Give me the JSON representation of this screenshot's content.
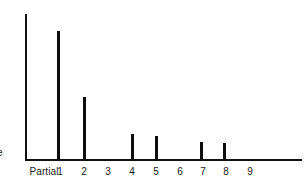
{
  "figure": {
    "name": "harmonic-partial-amplitude-spectrum",
    "axis_color": "#111111",
    "bar_color": "#0d0d0d",
    "background": "#ffffff",
    "y_axis_label_fragment": "e"
  },
  "axis": {
    "x_label_prefix": "Partial",
    "tick_labels": [
      "1",
      "2",
      "3",
      "4",
      "5",
      "6",
      "7",
      "8",
      "9"
    ]
  },
  "chart_data": {
    "type": "bar",
    "title": "",
    "xlabel": "Partial",
    "ylabel": "e",
    "categories": [
      "1",
      "2",
      "3",
      "4",
      "5",
      "6",
      "7",
      "8",
      "9"
    ],
    "values": [
      100,
      48,
      0,
      20,
      18,
      0,
      13,
      12,
      0
    ],
    "ylim": [
      0,
      115
    ],
    "grid": false,
    "legend": false
  },
  "bars": [
    {
      "label": "1",
      "x": 57,
      "height_px": 128,
      "value": 100
    },
    {
      "label": "2",
      "x": 83,
      "height_px": 62,
      "value": 48
    },
    {
      "label": "3",
      "x": 110,
      "height_px": 0,
      "value": 0
    },
    {
      "label": "4",
      "x": 131,
      "height_px": 25,
      "value": 20
    },
    {
      "label": "5",
      "x": 155,
      "height_px": 23,
      "value": 18
    },
    {
      "label": "6",
      "x": 179,
      "height_px": 0,
      "value": 0
    },
    {
      "label": "7",
      "x": 200,
      "height_px": 17,
      "value": 13
    },
    {
      "label": "8",
      "x": 223,
      "height_px": 16,
      "value": 12
    },
    {
      "label": "9",
      "x": 248,
      "height_px": 0,
      "value": 0
    }
  ],
  "tick_positions": {
    "partial_word_x": 44,
    "x": [
      60,
      84,
      108,
      132,
      156,
      180,
      203,
      226,
      250
    ]
  }
}
